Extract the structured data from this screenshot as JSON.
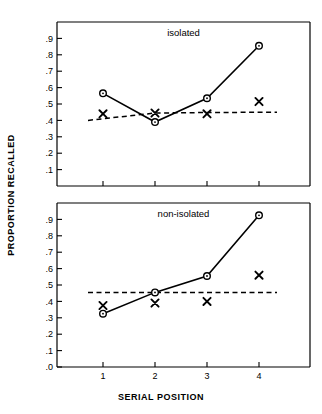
{
  "chart_data": [
    {
      "type": "line",
      "title": "isolated",
      "panel": "top",
      "xlabel": "",
      "ylabel": "PROPORTION RECALLED",
      "x": [
        1,
        2,
        3,
        4
      ],
      "categories": [
        "1",
        "2",
        "3",
        "4"
      ],
      "xtick_labels": [
        "1",
        "2",
        "3",
        "4"
      ],
      "ytick_labels": [
        ".1",
        ".2",
        ".3",
        ".4",
        ".5",
        ".6",
        ".7",
        ".8",
        ".9"
      ],
      "ytick_values": [
        0.1,
        0.2,
        0.3,
        0.4,
        0.5,
        0.6,
        0.7,
        0.8,
        0.9
      ],
      "xlim": [
        0.5,
        4.5
      ],
      "ylim": [
        0.0,
        1.0
      ],
      "grid": false,
      "legend": "none",
      "series": [
        {
          "name": "circle-solid",
          "marker": "circle",
          "line": "solid",
          "values": [
            0.565,
            0.39,
            0.535,
            0.855
          ]
        },
        {
          "name": "x-dashed",
          "marker": "x",
          "line": "dashed",
          "values": [
            0.44,
            0.445,
            0.44,
            0.515
          ]
        }
      ],
      "line_endpoints": {
        "dashed_left": 0.4,
        "dashed_right": 0.45
      }
    },
    {
      "type": "line",
      "title": "non-isolated",
      "panel": "bottom",
      "xlabel": "SERIAL POSITION",
      "ylabel": "PROPORTION RECALLED",
      "x": [
        1,
        2,
        3,
        4
      ],
      "categories": [
        "1",
        "2",
        "3",
        "4"
      ],
      "xtick_labels": [
        "1",
        "2",
        "3",
        "4"
      ],
      "ytick_labels": [
        ".0",
        ".1",
        ".2",
        ".3",
        ".4",
        ".5",
        ".6",
        ".7",
        ".8",
        ".9"
      ],
      "ytick_values": [
        0.0,
        0.1,
        0.2,
        0.3,
        0.4,
        0.5,
        0.6,
        0.7,
        0.8,
        0.9
      ],
      "xlim": [
        0.5,
        4.5
      ],
      "ylim": [
        0.0,
        1.0
      ],
      "grid": false,
      "legend": "none",
      "series": [
        {
          "name": "circle-solid",
          "marker": "circle",
          "line": "solid",
          "values": [
            0.325,
            0.455,
            0.555,
            0.925
          ]
        },
        {
          "name": "x-dashed",
          "marker": "x",
          "line": "dashed",
          "values": [
            0.375,
            0.39,
            0.4,
            0.56
          ]
        }
      ],
      "line_endpoints": {
        "dashed_left": 0.455,
        "dashed_right": 0.455
      }
    }
  ],
  "figure": {
    "y_axis_title": "PROPORTION RECALLED",
    "x_axis_title": "SERIAL POSITION",
    "top_panel_title": "isolated",
    "bottom_panel_title": "non-isolated",
    "background_color": "#ffffff",
    "ink_color": "#000000"
  }
}
